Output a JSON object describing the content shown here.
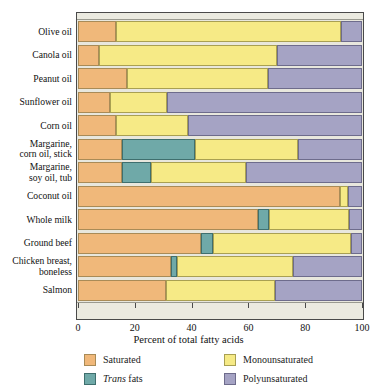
{
  "chart_data": {
    "type": "bar",
    "orientation": "horizontal",
    "stacked": true,
    "title": "",
    "xlabel": "Percent of total fatty acids",
    "ylabel": "",
    "xlim": [
      0,
      100
    ],
    "xticks": [
      0,
      20,
      40,
      60,
      80,
      100
    ],
    "grid": false,
    "legend_position": "bottom",
    "categories": [
      "Olive oil",
      "Canola oil",
      "Peanut oil",
      "Sunflower oil",
      "Corn oil",
      "Margarine,\ncorn oil, stick",
      "Margarine,\nsoy oil, tub",
      "Coconut oil",
      "Whole milk",
      "Ground beef",
      "Chicken breast,\nboneless",
      "Salmon"
    ],
    "series": [
      {
        "name": "Saturated",
        "color": "#f0b87a",
        "values": [
          13.4,
          7.4,
          17.2,
          11.3,
          13.4,
          15.5,
          15.5,
          92.3,
          63.4,
          43.3,
          32.7,
          31.0
        ]
      },
      {
        "name": "Trans fats",
        "color": "#6fa9a8",
        "values": [
          0,
          0,
          0,
          0,
          0,
          25.7,
          10.2,
          0,
          3.9,
          4.2,
          2.2,
          0
        ]
      },
      {
        "name": "Monounsaturated",
        "color": "#f6ea86",
        "values": [
          79.2,
          62.6,
          49.8,
          20.0,
          25.3,
          36.3,
          33.5,
          2.7,
          28.1,
          48.5,
          40.8,
          38.4
        ]
      },
      {
        "name": "Polyunsaturated",
        "color": "#a5a3c4",
        "values": [
          7.4,
          30.0,
          33.0,
          68.7,
          61.3,
          22.5,
          40.8,
          5.0,
          4.6,
          4.0,
          24.3,
          30.6
        ]
      }
    ]
  },
  "axis": {
    "xtick_labels": [
      "0",
      "20",
      "40",
      "60",
      "80",
      "100"
    ],
    "title": "Percent of total fatty acids"
  },
  "legend": {
    "items": [
      {
        "label": "Saturated",
        "key": "sat",
        "italic_prefix": ""
      },
      {
        "label": "Monounsaturated",
        "key": "mono",
        "italic_prefix": ""
      },
      {
        "label": "fats",
        "key": "tran",
        "italic_prefix": "Trans"
      },
      {
        "label": "Polyunsaturated",
        "key": "poly",
        "italic_prefix": ""
      }
    ]
  }
}
